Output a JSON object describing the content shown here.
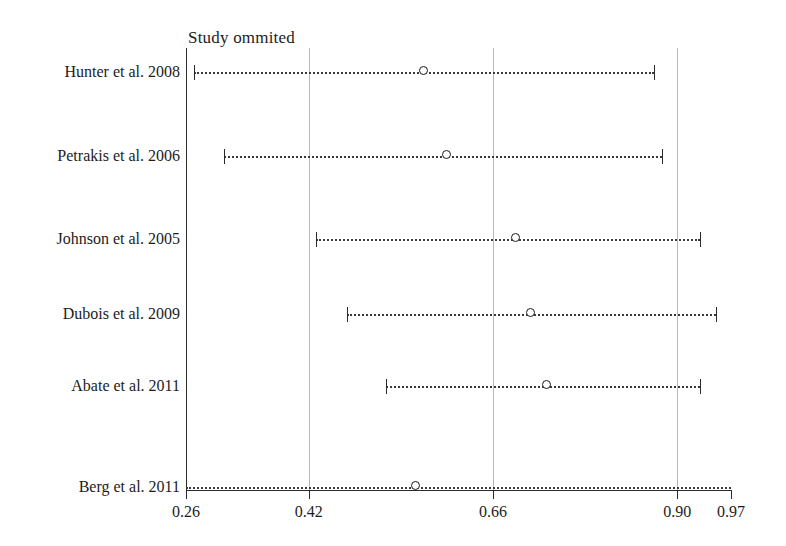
{
  "chart_data": {
    "type": "forest",
    "title": "Study ommited",
    "xlabel": "",
    "ylabel": "",
    "xlim": [
      0.26,
      0.97
    ],
    "grid": true,
    "legend": null,
    "xticks": [
      0.26,
      0.42,
      0.66,
      0.9,
      0.97
    ],
    "xtick_labels": [
      "0.26",
      "0.42",
      "0.66",
      "0.90",
      "0.97"
    ],
    "gridline_values": [
      0.42,
      0.66,
      0.9
    ],
    "categories": [
      "Hunter et al. 2008",
      "Petrakis et al. 2006",
      "Johnson et al. 2005",
      "Dubois et al. 2009",
      "Abate et al. 2011",
      "Berg et al. 2011"
    ],
    "points": [
      {
        "label": "Hunter et al. 2008",
        "estimate": 0.57,
        "ci_low": 0.27,
        "ci_high": 0.87,
        "clipped_low": false,
        "clipped_high": false
      },
      {
        "label": "Petrakis et al. 2006",
        "estimate": 0.6,
        "ci_low": 0.31,
        "ci_high": 0.88,
        "clipped_low": false,
        "clipped_high": false
      },
      {
        "label": "Johnson et al. 2005",
        "estimate": 0.69,
        "ci_low": 0.43,
        "ci_high": 0.93,
        "clipped_low": false,
        "clipped_high": false
      },
      {
        "label": "Dubois et al. 2009",
        "estimate": 0.71,
        "ci_low": 0.47,
        "ci_high": 0.95,
        "clipped_low": false,
        "clipped_high": false
      },
      {
        "label": "Abate et al. 2011",
        "estimate": 0.73,
        "ci_low": 0.52,
        "ci_high": 0.93,
        "clipped_low": false,
        "clipped_high": false
      },
      {
        "label": "Berg et al. 2011",
        "estimate": 0.56,
        "ci_low": 0.26,
        "ci_high": 0.97,
        "clipped_low": true,
        "clipped_high": true
      }
    ],
    "row_y": [
      73,
      157,
      240,
      315,
      387,
      488
    ],
    "colors": {
      "axis": "#2a2a2a",
      "gridline": "#b8b8b8",
      "ci": "#3a3a3a",
      "marker_edge": "#1a1a1a",
      "marker_fill": "#ffffff",
      "text": "#1c1c1c",
      "background": "#ffffff"
    }
  }
}
